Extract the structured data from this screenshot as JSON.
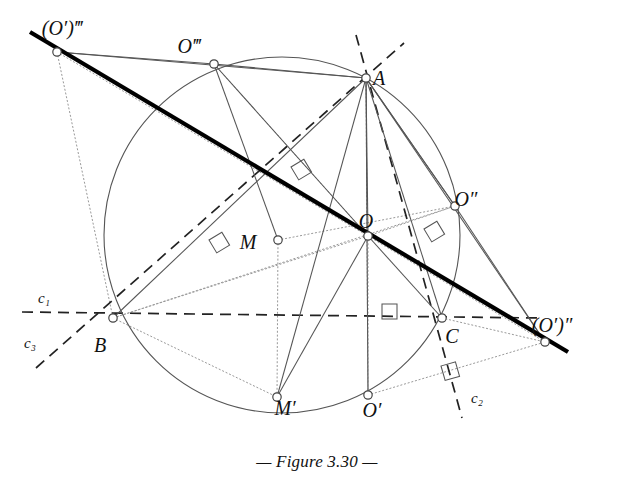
{
  "figure": {
    "caption": "— Figure 3.30 —",
    "caption_number": "3.30",
    "background_color": "#ffffff",
    "ink_color": "#111111",
    "thin_line_color": "#555555",
    "dotted_line_color": "#999999",
    "canvas": {
      "width": 634,
      "height": 503
    }
  },
  "points": [
    {
      "id": "Op3",
      "label": "(O′)‴",
      "x": 57,
      "y": 52,
      "label_x": 62,
      "label_y": 30,
      "marker": "open-circle"
    },
    {
      "id": "O3",
      "label": "O‴",
      "x": 214,
      "y": 64,
      "label_x": 189,
      "label_y": 48,
      "marker": "open-circle"
    },
    {
      "id": "A",
      "label": "A",
      "x": 366,
      "y": 78,
      "label_x": 379,
      "label_y": 80,
      "marker": "open-circle"
    },
    {
      "id": "O2",
      "label": "O″",
      "x": 455,
      "y": 206,
      "label_x": 466,
      "label_y": 201,
      "marker": "open-circle"
    },
    {
      "id": "O",
      "label": "O",
      "x": 368,
      "y": 236,
      "label_x": 366,
      "label_y": 223,
      "marker": "open-circle"
    },
    {
      "id": "M",
      "label": "M",
      "x": 278,
      "y": 240,
      "label_x": 248,
      "label_y": 244,
      "marker": "open-circle"
    },
    {
      "id": "B",
      "label": "B",
      "x": 113,
      "y": 318,
      "label_x": 100,
      "label_y": 347,
      "marker": "open-circle"
    },
    {
      "id": "C",
      "label": "C",
      "x": 442,
      "y": 318,
      "label_x": 452,
      "label_y": 338,
      "marker": "open-circle"
    },
    {
      "id": "Op2",
      "label": "(O′)″",
      "x": 545,
      "y": 342,
      "label_x": 552,
      "label_y": 327,
      "marker": "open-circle"
    },
    {
      "id": "Mp",
      "label": "M′",
      "x": 277,
      "y": 397,
      "label_x": 285,
      "label_y": 410,
      "marker": "open-circle"
    },
    {
      "id": "Op",
      "label": "O′",
      "x": 368,
      "y": 395,
      "label_x": 372,
      "label_y": 412,
      "marker": "open-circle"
    }
  ],
  "line_labels": [
    {
      "id": "c1",
      "label": "c₁",
      "x": 44,
      "y": 300
    },
    {
      "id": "c3",
      "label": "c₃",
      "x": 30,
      "y": 345
    },
    {
      "id": "c2",
      "label": "c₂",
      "x": 477,
      "y": 400
    }
  ],
  "circle": {
    "center_x": 282,
    "center_y": 235,
    "radius": 178,
    "style": "thin-solid",
    "passes_through": [
      "O3",
      "A",
      "O2",
      "C",
      "O′",
      "B"
    ]
  },
  "thick_line": {
    "id": "euler-line",
    "from": {
      "x": 30,
      "y": 32
    },
    "to": {
      "x": 568,
      "y": 352
    },
    "description": "bold line through (O′)‴, O and (O′)″"
  },
  "dashed_lines": [
    {
      "id": "c1-line",
      "x1": 22,
      "y1": 312,
      "x2": 540,
      "y2": 318,
      "desc": "horizontal dashed line c1 through B and C"
    },
    {
      "id": "c3-line",
      "x1": 36,
      "y1": 368,
      "x2": 404,
      "y2": 43,
      "desc": "dashed line c3 through B toward upper right"
    },
    {
      "id": "c2-line",
      "x1": 356,
      "y1": 35,
      "x2": 462,
      "y2": 418,
      "desc": "dashed line c2 through A and C"
    }
  ],
  "solid_thin_lines": [
    {
      "x1": 57,
      "y1": 52,
      "x2": 214,
      "y2": 64
    },
    {
      "x1": 214,
      "y1": 64,
      "x2": 366,
      "y2": 78
    },
    {
      "x1": 57,
      "y1": 52,
      "x2": 366,
      "y2": 78
    },
    {
      "x1": 366,
      "y1": 78,
      "x2": 455,
      "y2": 206
    },
    {
      "x1": 455,
      "y1": 206,
      "x2": 545,
      "y2": 342
    },
    {
      "x1": 366,
      "y1": 78,
      "x2": 545,
      "y2": 342
    },
    {
      "x1": 214,
      "y1": 64,
      "x2": 278,
      "y2": 240
    },
    {
      "x1": 214,
      "y1": 64,
      "x2": 368,
      "y2": 236
    },
    {
      "x1": 366,
      "y1": 78,
      "x2": 277,
      "y2": 397
    },
    {
      "x1": 366,
      "y1": 78,
      "x2": 368,
      "y2": 395
    },
    {
      "x1": 366,
      "y1": 78,
      "x2": 442,
      "y2": 318
    },
    {
      "x1": 366,
      "y1": 78,
      "x2": 368,
      "y2": 236
    },
    {
      "x1": 366,
      "y1": 78,
      "x2": 113,
      "y2": 318
    },
    {
      "x1": 368,
      "y1": 236,
      "x2": 277,
      "y2": 397
    },
    {
      "x1": 368,
      "y1": 236,
      "x2": 442,
      "y2": 318
    },
    {
      "x1": 366,
      "y1": 78,
      "x2": 455,
      "y2": 206
    }
  ],
  "dotted_lines": [
    {
      "x1": 57,
      "y1": 52,
      "x2": 368,
      "y2": 236
    },
    {
      "x1": 57,
      "y1": 52,
      "x2": 113,
      "y2": 318
    },
    {
      "x1": 214,
      "y1": 64,
      "x2": 368,
      "y2": 236
    },
    {
      "x1": 366,
      "y1": 78,
      "x2": 368,
      "y2": 395
    },
    {
      "x1": 368,
      "y1": 236,
      "x2": 455,
      "y2": 206
    },
    {
      "x1": 368,
      "y1": 236,
      "x2": 113,
      "y2": 318
    },
    {
      "x1": 368,
      "y1": 236,
      "x2": 545,
      "y2": 342
    },
    {
      "x1": 368,
      "y1": 236,
      "x2": 368,
      "y2": 395
    },
    {
      "x1": 113,
      "y1": 318,
      "x2": 455,
      "y2": 206
    },
    {
      "x1": 278,
      "y1": 240,
      "x2": 455,
      "y2": 206
    },
    {
      "x1": 278,
      "y1": 240,
      "x2": 277,
      "y2": 397
    },
    {
      "x1": 442,
      "y1": 318,
      "x2": 545,
      "y2": 342
    },
    {
      "x1": 368,
      "y1": 395,
      "x2": 545,
      "y2": 342
    },
    {
      "x1": 113,
      "y1": 318,
      "x2": 277,
      "y2": 397
    }
  ],
  "right_angle_marks": [
    {
      "id": "ra-1",
      "x": 291,
      "y": 167,
      "rot": -31
    },
    {
      "id": "ra-2",
      "x": 209,
      "y": 240,
      "rot": -31
    },
    {
      "id": "ra-3",
      "x": 424,
      "y": 229,
      "rot": -31
    },
    {
      "id": "ra-4",
      "x": 382,
      "y": 304,
      "rot": 0
    },
    {
      "id": "ra-5",
      "x": 441,
      "y": 366,
      "rot": -16
    }
  ]
}
